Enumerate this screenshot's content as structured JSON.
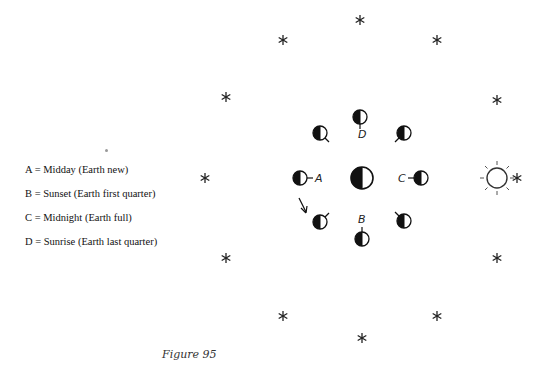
{
  "legend": {
    "items": [
      {
        "label": "A = Midday (Earth new)"
      },
      {
        "label": "B = Sunset (Earth first quarter)"
      },
      {
        "label": "C = Midnight (Earth full)"
      },
      {
        "label": "D = Sunrise (Earth last quarter)"
      }
    ]
  },
  "diagram": {
    "center_body": "Earth (half lit, dark left side)",
    "sun_symbol": "sun-icon",
    "star_symbol": "*",
    "position_labels": {
      "A": "A",
      "B": "B",
      "C": "C",
      "D": "D"
    },
    "stars": [
      {
        "x": 360,
        "y": 20
      },
      {
        "x": 283,
        "y": 40
      },
      {
        "x": 437,
        "y": 40
      },
      {
        "x": 226,
        "y": 97
      },
      {
        "x": 497,
        "y": 100
      },
      {
        "x": 205,
        "y": 178
      },
      {
        "x": 226,
        "y": 258
      },
      {
        "x": 497,
        "y": 258
      },
      {
        "x": 283,
        "y": 316
      },
      {
        "x": 437,
        "y": 316
      },
      {
        "x": 362,
        "y": 338
      }
    ],
    "colors": {
      "ink": "#111111",
      "background": "#ffffff",
      "caption": "#333333"
    }
  },
  "caption": "Figure 95"
}
